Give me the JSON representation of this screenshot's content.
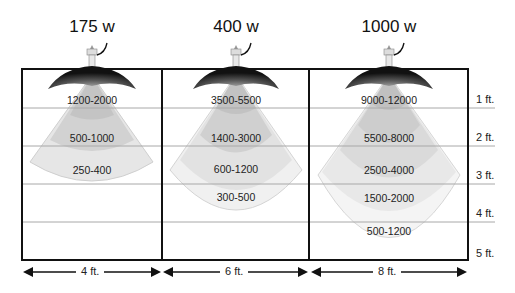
{
  "diagram": {
    "lamps": [
      {
        "wattage": "175 w",
        "width_label": "4 ft.",
        "zones": [
          "1200-2000",
          "500-1000",
          "250-400"
        ]
      },
      {
        "wattage": "400 w",
        "width_label": "6 ft.",
        "zones": [
          "3500-5500",
          "1400-3000",
          "600-1200",
          "300-500"
        ]
      },
      {
        "wattage": "1000 w",
        "width_label": "8 ft.",
        "zones": [
          "9000-12000",
          "5500-8000",
          "2500-4000",
          "1500-2000",
          "500-1200"
        ]
      }
    ],
    "distance_labels": [
      "1 ft.",
      "2 ft.",
      "3 ft.",
      "4 ft.",
      "5 ft."
    ],
    "colors": {
      "grid_line": "#a8a8a8",
      "border": "#111111",
      "zone_dark": "#b8b8b8",
      "zone_mid": "#cccccc",
      "zone_light": "#e0e0e0",
      "zone_lighter": "#ececec",
      "zone_lightest": "#f4f4f4",
      "reflector": "#1a1a1a"
    }
  }
}
